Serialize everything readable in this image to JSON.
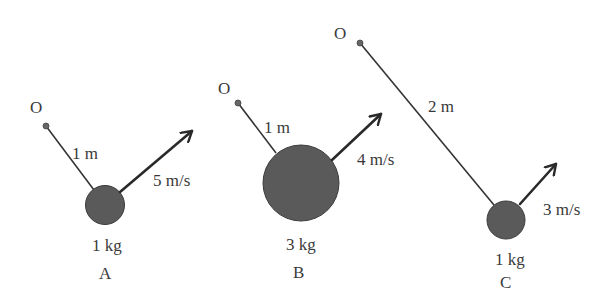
{
  "diagram": {
    "type": "rotating masses on rods about pivot O",
    "colors": {
      "ball": "#5a5a5a",
      "line": "#333333",
      "text": "#3a3a3a",
      "background": "#ffffff"
    },
    "systems": [
      {
        "id": "A",
        "label": "A",
        "pivot_label": "O",
        "length": "1 m",
        "velocity": "5 m/s",
        "mass": "1 kg"
      },
      {
        "id": "B",
        "label": "B",
        "pivot_label": "O",
        "length": "1 m",
        "velocity": "4 m/s",
        "mass": "3 kg"
      },
      {
        "id": "C",
        "label": "C",
        "pivot_label": "O",
        "length": "2 m",
        "velocity": "3 m/s",
        "mass": "1 kg"
      }
    ]
  }
}
